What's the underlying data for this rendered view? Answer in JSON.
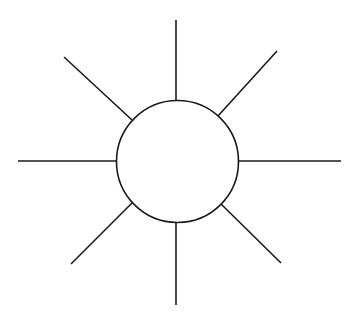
{
  "diagram": {
    "type": "sun-diagram",
    "background": "#ffffff",
    "stroke_color": "#1a1a1a",
    "stroke_width": 1.6,
    "center": {
      "shape": "circle",
      "cx": 177.5,
      "cy": 161.5,
      "r": 61,
      "fill": "#ffffff",
      "label": ""
    },
    "rays": [
      {
        "name": "ray-top",
        "x1": 176,
        "y1": 20,
        "x2": 176,
        "y2": 100
      },
      {
        "name": "ray-top-right",
        "x1": 277,
        "y1": 51,
        "x2": 218,
        "y2": 116
      },
      {
        "name": "ray-right",
        "x1": 238,
        "y1": 161,
        "x2": 341,
        "y2": 161
      },
      {
        "name": "ray-bottom-right",
        "x1": 221,
        "y1": 204,
        "x2": 281,
        "y2": 263
      },
      {
        "name": "ray-bottom",
        "x1": 176,
        "y1": 223,
        "x2": 176,
        "y2": 305
      },
      {
        "name": "ray-bottom-left",
        "x1": 132,
        "y1": 203,
        "x2": 71,
        "y2": 264
      },
      {
        "name": "ray-left",
        "x1": 18,
        "y1": 161,
        "x2": 117,
        "y2": 161
      },
      {
        "name": "ray-top-left",
        "x1": 64,
        "y1": 57,
        "x2": 132,
        "y2": 120
      }
    ]
  }
}
